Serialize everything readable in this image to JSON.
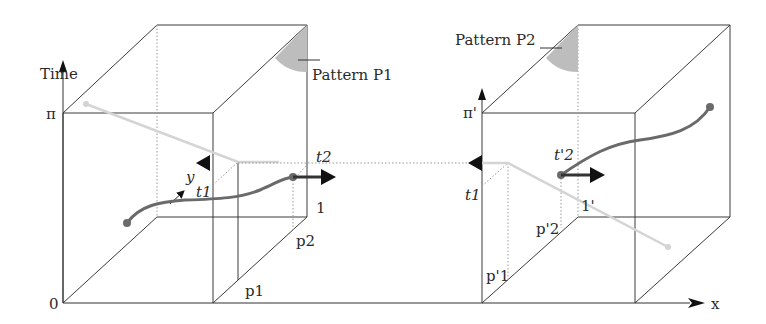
{
  "colors": {
    "line": "#3a3a3a",
    "dotted": "#8a8a8a",
    "pattern_fill": "#bdbdbd",
    "trajectory_dark": "#6a6a6a",
    "trajectory_light": "#d4d4d4",
    "arrow": "#111111"
  },
  "axes": {
    "time_label": "Time",
    "x_label": "x",
    "origin_label": "0",
    "pi_label": "π",
    "pi_prime_label": "π'"
  },
  "left_cube": {
    "pattern_label": "Pattern P1",
    "t1_label": "t1",
    "t2_label": "t2",
    "y_label": "y",
    "one_label": "1",
    "p1_label": "p1",
    "p2_label": "p2"
  },
  "right_cube": {
    "pattern_label": "Pattern P2",
    "t1_label": "t1",
    "t2_label": "t'2",
    "one_label": "1'",
    "p1_label": "p'1",
    "p2_label": "p'2"
  }
}
